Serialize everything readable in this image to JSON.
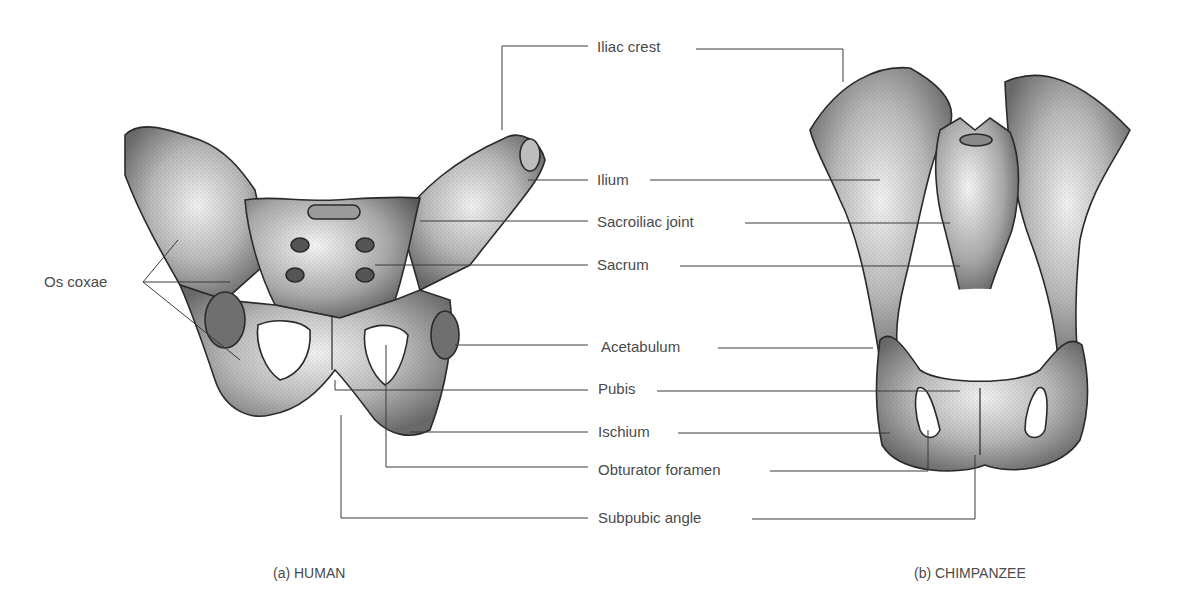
{
  "figure": {
    "labels": [
      {
        "id": "iliac-crest",
        "text": "Iliac crest",
        "x": 597,
        "y": 47
      },
      {
        "id": "ilium",
        "text": "Ilium",
        "x": 597,
        "y": 180
      },
      {
        "id": "sacroiliac-joint",
        "text": "Sacroiliac joint",
        "x": 597,
        "y": 222
      },
      {
        "id": "sacrum",
        "text": "Sacrum",
        "x": 597,
        "y": 265
      },
      {
        "id": "acetabulum",
        "text": "Acetabulum",
        "x": 601,
        "y": 347
      },
      {
        "id": "pubis",
        "text": "Pubis",
        "x": 598,
        "y": 389
      },
      {
        "id": "ischium",
        "text": "Ischium",
        "x": 598,
        "y": 432
      },
      {
        "id": "obturator-foramen",
        "text": "Obturator foramen",
        "x": 598,
        "y": 470
      },
      {
        "id": "subpubic-angle",
        "text": "Subpubic angle",
        "x": 598,
        "y": 517
      }
    ],
    "left_label": {
      "text": "Os coxae",
      "x": 44,
      "y": 282
    },
    "captions": {
      "human": "(a) HUMAN",
      "chimpanzee": "(b) CHIMPANZEE"
    },
    "colors": {
      "ink": "#3a3a3a",
      "bone_light": "#e8e8e8",
      "bone_mid": "#9a9a9a",
      "bone_dark": "#5a5a5a",
      "text": "#4a4a4a"
    }
  }
}
